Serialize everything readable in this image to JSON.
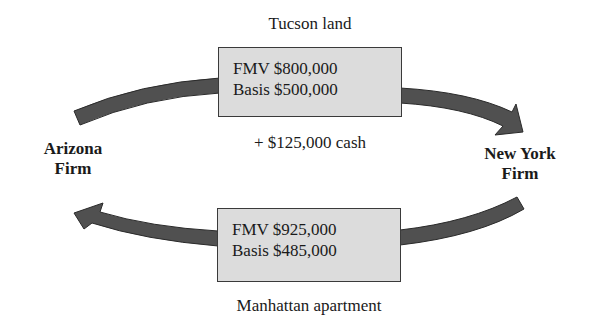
{
  "diagram": {
    "top_transfer": {
      "title": "Tucson land",
      "fmv": "FMV $800,000",
      "basis": "Basis $500,000",
      "extra": "+ $125,000 cash",
      "direction": "Arizona Firm -> New York Firm"
    },
    "bottom_transfer": {
      "title": "Manhattan apartment",
      "fmv": "FMV $925,000",
      "basis": "Basis $485,000",
      "direction": "New York Firm -> Arizona Firm"
    },
    "parties": {
      "left": {
        "line1": "Arizona",
        "line2": "Firm"
      },
      "right": {
        "line1": "New York",
        "line2": "Firm"
      }
    },
    "colors": {
      "arrow": "#505050",
      "arrow_outline": "#2a2a2a",
      "box_fill": "#dcdcdc",
      "box_border": "#3a3a3a"
    }
  }
}
